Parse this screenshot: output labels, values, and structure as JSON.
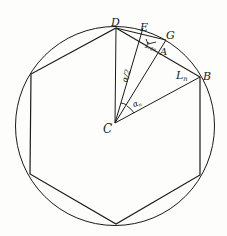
{
  "diagram": {
    "type": "geometry",
    "points": {
      "C": {
        "label": "C",
        "x": 115,
        "y": 123
      },
      "D": {
        "label": "D",
        "x": 116,
        "y": 28
      },
      "E": {
        "label": "E",
        "x": 143,
        "y": 28
      },
      "G": {
        "label": "G",
        "x": 166,
        "y": 40
      },
      "A": {
        "label": "A",
        "x": 158,
        "y": 52
      },
      "B": {
        "label": "B",
        "x": 200,
        "y": 77
      }
    },
    "circle": {
      "cx": 115,
      "cy": 126,
      "r": 100
    },
    "hexagon": [
      [
        116,
        28
      ],
      [
        200,
        77
      ],
      [
        200,
        175
      ],
      [
        116,
        224
      ],
      [
        30,
        174
      ],
      [
        31,
        74
      ]
    ],
    "labels": {
      "D": "D",
      "E": "E",
      "G": "G",
      "A": "A",
      "B": "B",
      "C": "C",
      "L2n_main": "L",
      "L2n_sub": "2n",
      "Ln_main": "L",
      "Ln_sub": "n",
      "alpha_half": "α/2",
      "alpha_n_main": "α",
      "alpha_n_sub": "n"
    },
    "colors": {
      "stroke": "#1a1a1a",
      "background": "#fdfdfb"
    }
  }
}
